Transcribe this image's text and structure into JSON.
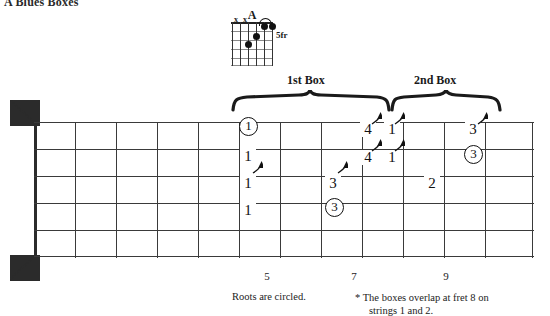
{
  "page": {
    "title": "A Blues Boxes"
  },
  "chord": {
    "name": "A",
    "position_label": "5fr",
    "muted_markers": [
      "x",
      "x"
    ],
    "dots": [
      {
        "string": 4,
        "fret": 3
      },
      {
        "string": 3,
        "fret": 2
      },
      {
        "string": 2,
        "fret": 1
      },
      {
        "string": 1,
        "fret": 1
      }
    ],
    "tie_strings": [
      2,
      1
    ],
    "strings": 6,
    "frets": 5
  },
  "boxes": [
    {
      "label": "1st Box"
    },
    {
      "label": "2nd Box"
    }
  ],
  "fretboard": {
    "strings": 6,
    "frets": 12,
    "fret_markers": [
      {
        "number": "5"
      },
      {
        "number": "7"
      },
      {
        "number": "9"
      }
    ],
    "notes": [
      {
        "label": "1",
        "circled": true,
        "arrow": false
      },
      {
        "label": "1",
        "circled": false,
        "arrow": false
      },
      {
        "label": "1",
        "circled": false,
        "arrow": true
      },
      {
        "label": "1",
        "circled": false,
        "arrow": false
      },
      {
        "label": "3",
        "circled": false,
        "arrow": true
      },
      {
        "label": "3",
        "circled": true,
        "arrow": false
      },
      {
        "label": "4",
        "circled": false,
        "arrow": true
      },
      {
        "label": "1",
        "circled": false,
        "arrow": true
      },
      {
        "label": "4",
        "circled": false,
        "arrow": true
      },
      {
        "label": "1",
        "circled": false,
        "arrow": true
      },
      {
        "label": "2",
        "circled": false,
        "arrow": false
      },
      {
        "label": "3",
        "circled": false,
        "arrow": true
      },
      {
        "label": "3",
        "circled": true,
        "arrow": false
      }
    ]
  },
  "captions": {
    "roots": "Roots are circled.",
    "footnote_line1": "* The boxes overlap at fret 8 on",
    "footnote_line2": "strings 1 and 2."
  },
  "colors": {
    "ink": "#1a1a1a",
    "line": "#3a3a3a",
    "background": "#ffffff"
  }
}
